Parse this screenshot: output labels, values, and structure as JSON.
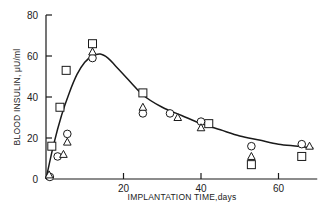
{
  "chart_data": {
    "type": "scatter",
    "title": "",
    "xlabel": "IMPLANTATION TIME,days",
    "ylabel": "BLOOD INSULIN, μU/ml",
    "xlim": [
      0,
      70
    ],
    "ylim": [
      0,
      80
    ],
    "xticks": [
      20,
      40,
      60
    ],
    "yticks": [
      0,
      20,
      40,
      60,
      80
    ],
    "grid": false,
    "legend": null,
    "series": [
      {
        "name": "squares",
        "marker": "square",
        "points": [
          [
            1.5,
            16
          ],
          [
            3.6,
            35
          ],
          [
            5.2,
            53
          ],
          [
            12,
            66
          ],
          [
            25,
            42
          ],
          [
            42,
            27
          ],
          [
            53,
            7
          ],
          [
            66,
            11
          ]
        ]
      },
      {
        "name": "circles",
        "marker": "circle",
        "points": [
          [
            1,
            1
          ],
          [
            3,
            11
          ],
          [
            5.5,
            22
          ],
          [
            12,
            59
          ],
          [
            25,
            32
          ],
          [
            32,
            32
          ],
          [
            40,
            28
          ],
          [
            53,
            16
          ],
          [
            66,
            17
          ]
        ]
      },
      {
        "name": "triangles",
        "marker": "triangle",
        "points": [
          [
            0.8,
            2
          ],
          [
            4.5,
            12
          ],
          [
            5.5,
            18
          ],
          [
            12,
            62
          ],
          [
            25,
            35
          ],
          [
            34,
            30
          ],
          [
            40,
            25
          ],
          [
            53,
            11
          ],
          [
            68,
            16
          ]
        ]
      },
      {
        "name": "fit-curve",
        "marker": "line",
        "points": [
          [
            0,
            0
          ],
          [
            2,
            17
          ],
          [
            4,
            31
          ],
          [
            6,
            42
          ],
          [
            8,
            51
          ],
          [
            10,
            57
          ],
          [
            12,
            60
          ],
          [
            14,
            61
          ],
          [
            16,
            59
          ],
          [
            18,
            55
          ],
          [
            20,
            51
          ],
          [
            25,
            41
          ],
          [
            30,
            35
          ],
          [
            35,
            31
          ],
          [
            40,
            27
          ],
          [
            45,
            24
          ],
          [
            50,
            21
          ],
          [
            55,
            19
          ],
          [
            60,
            17
          ],
          [
            65,
            16
          ],
          [
            69,
            15
          ]
        ]
      }
    ]
  }
}
